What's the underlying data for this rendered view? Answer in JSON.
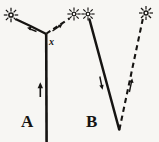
{
  "figure": {
    "background_color": "#f7f6f3",
    "ink_color": "#161412",
    "width": 159,
    "height": 142,
    "labels": {
      "panel_a": "A",
      "panel_b": "B",
      "point_x": "x"
    },
    "panels": [
      {
        "id": "A",
        "label": "A",
        "elements": [
          {
            "name": "star-top-left",
            "icon": "star-burst-icon",
            "x": 11,
            "y": 15
          },
          {
            "name": "star-top-mid-left",
            "icon": "star-burst-icon",
            "x": 74,
            "y": 14
          },
          {
            "name": "solid-ray-left",
            "style": "solid",
            "from": [
              14,
              18
            ],
            "to": [
              45,
              33
            ]
          },
          {
            "name": "dashed-ray-right",
            "style": "dashed",
            "from": [
              46,
              34
            ],
            "to": [
              70,
              17
            ]
          },
          {
            "name": "solid-vertical-path",
            "style": "solid",
            "from": [
              46,
              34
            ],
            "to": [
              47,
              140
            ]
          },
          {
            "name": "direction-arrow-vertical",
            "style": "arrow",
            "direction": "up",
            "x": 40,
            "y": 90
          },
          {
            "name": "direction-arrow-left-ray",
            "style": "arrow",
            "direction": "up-left",
            "x": 32,
            "y": 30
          },
          {
            "name": "direction-arrow-dashed-ray",
            "style": "arrow",
            "direction": "up-right",
            "x": 58,
            "y": 26
          },
          {
            "name": "vertex-label-x",
            "text": "x",
            "x": 52,
            "y": 42
          }
        ]
      },
      {
        "id": "B",
        "label": "B",
        "elements": [
          {
            "name": "star-top-mid-right",
            "icon": "star-burst-icon",
            "x": 88,
            "y": 14
          },
          {
            "name": "star-top-right",
            "icon": "star-burst-icon",
            "x": 146,
            "y": 13
          },
          {
            "name": "solid-ray-descending",
            "style": "solid",
            "from": [
              89,
              18
            ],
            "to": [
              119,
              129
            ]
          },
          {
            "name": "dashed-ray-ascending",
            "style": "dashed",
            "from": [
              119,
              129
            ],
            "to": [
              143,
              17
            ]
          },
          {
            "name": "direction-arrow-solid",
            "style": "arrow",
            "direction": "down",
            "x": 101,
            "y": 85
          },
          {
            "name": "direction-arrow-dashed",
            "style": "arrow",
            "direction": "up",
            "x": 130,
            "y": 84
          }
        ]
      }
    ]
  }
}
